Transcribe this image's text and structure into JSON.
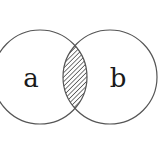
{
  "diagram": {
    "type": "venn",
    "sets": [
      {
        "id": "a",
        "label": "a",
        "cx": 40,
        "cy": 77,
        "r": 47
      },
      {
        "id": "b",
        "label": "b",
        "cx": 110,
        "cy": 77,
        "r": 47
      }
    ],
    "highlighted_region": "a ∩ b",
    "highlight_style": "diagonal-hatch",
    "colors": {
      "stroke": "#555555",
      "hatch": "#333333",
      "text": "#1a1a1a",
      "background": "#ffffff"
    }
  }
}
